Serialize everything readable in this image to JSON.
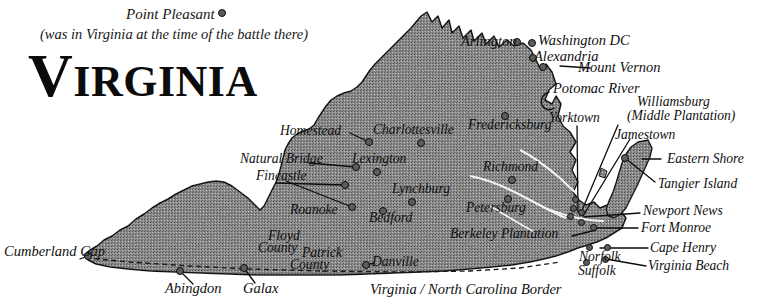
{
  "title": {
    "heading": "VIRGINIA",
    "heading_cap": "V",
    "heading_rest": "IRGINIA",
    "note_line1": "Point Pleasant",
    "note_line2": "(was in Virginia at the time of the battle there)"
  },
  "border_label": "Virginia / North Carolina Border",
  "colors": {
    "state_fill": "#9a9a9a",
    "state_outline": "#161616",
    "ink": "#101010",
    "dot_fill": "#5d5d5d",
    "dot_stroke": "#0d0d0d",
    "page": "#ffffff"
  },
  "map_data": {
    "type": "map",
    "subject": "Commonwealth of Virginia",
    "projection_note": "stylized historical outline map",
    "features": [
      {
        "name": "Virginia state body",
        "kind": "landmass"
      },
      {
        "name": "Eastern Shore peninsula",
        "kind": "landmass"
      },
      {
        "name": "Potomac River",
        "kind": "river"
      },
      {
        "name": "Chesapeake Bay",
        "kind": "water"
      },
      {
        "name": "Virginia / North Carolina Border",
        "kind": "boundary"
      }
    ],
    "places": [
      {
        "label": "Point Pleasant",
        "x": 222,
        "y": 13,
        "marker": true,
        "note": "was in Virginia at the time of the battle there"
      },
      {
        "label": "Arlington",
        "x": 513,
        "y": 42,
        "marker": true
      },
      {
        "label": "Washington DC",
        "x": 529,
        "y": 43,
        "marker": true
      },
      {
        "label": "Alexandria",
        "x": 529,
        "y": 58,
        "marker": true
      },
      {
        "label": "Mount Vernon",
        "x": 540,
        "y": 67,
        "marker": true
      },
      {
        "label": "Potomac River",
        "x": 551,
        "y": 88,
        "marker": false
      },
      {
        "label": "Williamsburg",
        "x": 676,
        "y": 101,
        "marker": false
      },
      {
        "label": "(Middle Plantation)",
        "x": 676,
        "y": 114,
        "marker": false
      },
      {
        "label": "Yorktown",
        "x": 578,
        "y": 118,
        "marker": false
      },
      {
        "label": "Jamestown",
        "x": 655,
        "y": 134,
        "marker": false
      },
      {
        "label": "Homestead",
        "x": 373,
        "y": 138,
        "marker": true
      },
      {
        "label": "Charlottesville",
        "x": 421,
        "y": 143,
        "marker": true
      },
      {
        "label": "Fredericksburg",
        "x": 505,
        "y": 116,
        "marker": true
      },
      {
        "label": "Eastern Shore",
        "x": 668,
        "y": 159,
        "marker": false
      },
      {
        "label": "Natural Bridge",
        "x": 303,
        "y": 159,
        "marker": true
      },
      {
        "label": "Lexington",
        "x": 377,
        "y": 172,
        "marker": true
      },
      {
        "label": "Fincastle",
        "x": 290,
        "y": 176,
        "marker": true
      },
      {
        "label": "Richmond",
        "x": 512,
        "y": 180,
        "marker": true
      },
      {
        "label": "Tangier Island",
        "x": 662,
        "y": 184,
        "marker": true
      },
      {
        "label": "Lynchburg",
        "x": 412,
        "y": 202,
        "marker": true
      },
      {
        "label": "Roanoke",
        "x": 344,
        "y": 212,
        "marker": true
      },
      {
        "label": "Bedford",
        "x": 383,
        "y": 211,
        "marker": true
      },
      {
        "label": "Petersburg",
        "x": 508,
        "y": 199,
        "marker": true
      },
      {
        "label": "Newport News",
        "x": 647,
        "y": 213,
        "marker": true
      },
      {
        "label": "Berkeley Plantation",
        "x": 500,
        "y": 235,
        "marker": false
      },
      {
        "label": "Fort Monroe",
        "x": 645,
        "y": 228,
        "marker": true
      },
      {
        "label": "Cape Henry",
        "x": 654,
        "y": 250,
        "marker": true
      },
      {
        "label": "Norfolk",
        "x": 598,
        "y": 258,
        "marker": true
      },
      {
        "label": "Virginia Beach",
        "x": 653,
        "y": 268,
        "marker": true
      },
      {
        "label": "Suffolk",
        "x": 596,
        "y": 272,
        "marker": true
      },
      {
        "label": "Floyd County",
        "x": 286,
        "y": 237,
        "marker": false
      },
      {
        "label": "Patrick County",
        "x": 318,
        "y": 254,
        "marker": false
      },
      {
        "label": "Danville",
        "x": 380,
        "y": 262,
        "marker": true
      },
      {
        "label": "Cumberland Gap",
        "x": 50,
        "y": 252,
        "marker": true
      },
      {
        "label": "Abingdon",
        "x": 190,
        "y": 288,
        "marker": true
      },
      {
        "label": "Galax",
        "x": 255,
        "y": 288,
        "marker": true
      }
    ]
  },
  "labels": {
    "point_pleasant": "Point Pleasant",
    "arlington": "Arlington",
    "washington_dc": "Washington DC",
    "alexandria": "Alexandria",
    "mount_vernon": "Mount Vernon",
    "potomac_river": "Potomac River",
    "williamsburg": "Williamsburg",
    "middle_plantation": "(Middle Plantation)",
    "yorktown": "Yorktown",
    "jamestown": "Jamestown",
    "homestead": "Homestead",
    "charlottesville": "Charlottesville",
    "fredericksburg": "Fredericksburg",
    "eastern_shore": "Eastern Shore",
    "natural_bridge": "Natural Bridge",
    "lexington": "Lexington",
    "fincastle": "Fincastle",
    "richmond": "Richmond",
    "tangier_island": "Tangier Island",
    "lynchburg": "Lynchburg",
    "roanoke": "Roanoke",
    "bedford": "Bedford",
    "petersburg": "Petersburg",
    "newport_news": "Newport News",
    "berkeley_plantation": "Berkeley Plantation",
    "fort_monroe": "Fort Monroe",
    "cape_henry": "Cape Henry",
    "norfolk": "Norfolk",
    "virginia_beach": "Virginia Beach",
    "suffolk": "Suffolk",
    "floyd": "Floyd",
    "county1": "County",
    "patrick": "Patrick",
    "county2": "County",
    "danville": "Danville",
    "cumberland_gap": "Cumberland Gap",
    "abingdon": "Abingdon",
    "galax": "Galax",
    "border": "Virginia / North Carolina Border"
  }
}
